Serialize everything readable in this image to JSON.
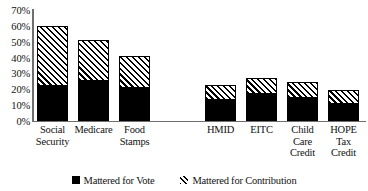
{
  "chart_data": {
    "type": "bar",
    "stacked": true,
    "title": "",
    "xlabel": "",
    "ylabel": "",
    "ylim": [
      0,
      70
    ],
    "y_unit": "%",
    "grid": false,
    "legend_position": "bottom",
    "y_ticks": [
      0,
      10,
      20,
      30,
      40,
      50,
      60,
      70
    ],
    "y_tick_labels": [
      "0%",
      "10%",
      "20%",
      "30%",
      "40%",
      "50%",
      "60%",
      "70%"
    ],
    "categories": [
      "Social Security",
      "Medicare",
      "Food Stamps",
      "HMID",
      "EITC",
      "Child Care Credit",
      "HOPE Tax Credit"
    ],
    "category_label_lines": [
      [
        "Social",
        "Security"
      ],
      [
        "Medicare"
      ],
      [
        "Food",
        "Stamps"
      ],
      [
        "HMID"
      ],
      [
        "EITC"
      ],
      [
        "Child",
        "Care",
        "Credit"
      ],
      [
        "HOPE",
        "Tax",
        "Credit"
      ]
    ],
    "series": [
      {
        "name": "Mattered for Vote",
        "fill": "solid",
        "color": "#000000",
        "values": [
          23,
          26,
          21.5,
          14,
          17.5,
          15,
          11.5
        ]
      },
      {
        "name": "Mattered for Contribution",
        "fill": "diagonal-hatch",
        "color": "#000000",
        "values": [
          37,
          25,
          19.5,
          9,
          9.5,
          9.5,
          8
        ]
      }
    ],
    "totals": [
      60,
      51,
      41,
      23,
      27,
      24.5,
      19.5
    ],
    "groups": [
      {
        "name": "spending-programs",
        "category_indices": [
          0,
          1,
          2
        ]
      },
      {
        "name": "tax-expenditures",
        "category_indices": [
          3,
          4,
          5,
          6
        ]
      }
    ]
  },
  "legend": {
    "items": [
      {
        "label": "Mattered for Vote",
        "swatch": "solid-square"
      },
      {
        "label": "Mattered for Contribution",
        "swatch": "hatched-square"
      }
    ]
  },
  "colors": {
    "bar_solid": "#000000",
    "bar_hatch_line": "#000000",
    "bar_hatch_background": "#ffffff",
    "axis": "#6f6f6f",
    "text": "#111111",
    "page_background": "#ffffff"
  }
}
